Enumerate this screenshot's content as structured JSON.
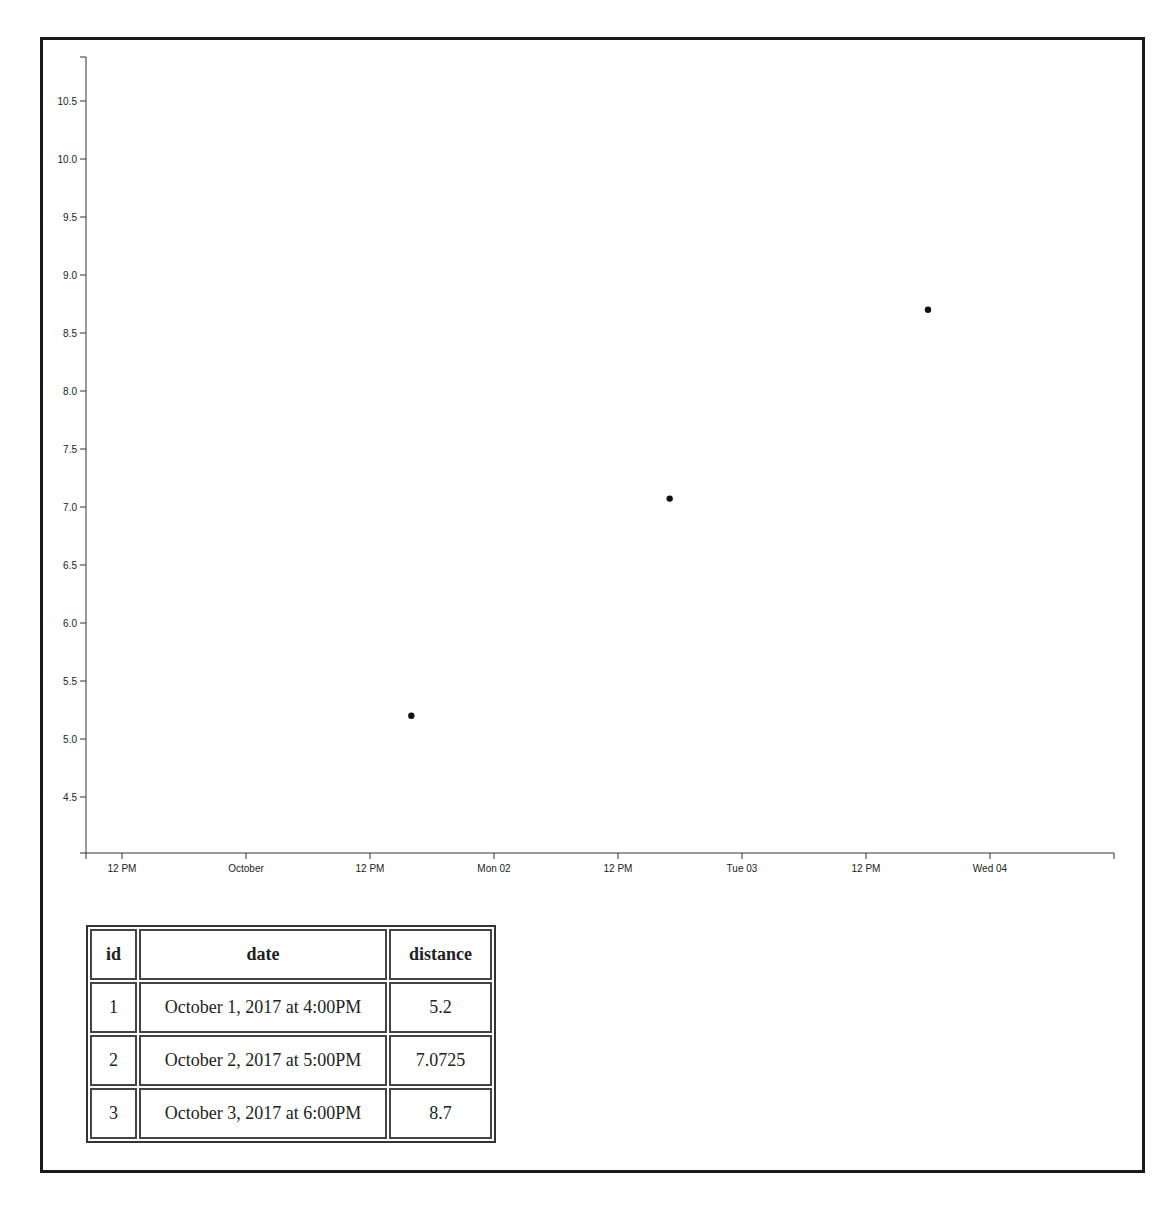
{
  "chart_data": {
    "type": "scatter",
    "title": "",
    "xlabel": "",
    "ylabel": "",
    "x_type": "time",
    "x_ticks": [
      "12 PM",
      "October",
      "12 PM",
      "Mon 02",
      "12 PM",
      "Tue 03",
      "12 PM",
      "Wed 04"
    ],
    "y_ticks": [
      "4.5",
      "5.0",
      "5.5",
      "6.0",
      "6.5",
      "7.0",
      "7.5",
      "8.0",
      "8.5",
      "9.0",
      "9.5",
      "10.0",
      "10.5"
    ],
    "ylim": [
      4.0,
      10.9
    ],
    "grid": false,
    "legend": null,
    "points": [
      {
        "x": "2017-10-01T16:00",
        "y": 5.2
      },
      {
        "x": "2017-10-02T17:00",
        "y": 7.0725
      },
      {
        "x": "2017-10-03T18:00",
        "y": 8.7
      }
    ],
    "x": [
      "October 1, 2017 at 4:00PM",
      "October 2, 2017 at 5:00PM",
      "October 3, 2017 at 6:00PM"
    ],
    "values": [
      5.2,
      7.0725,
      8.7
    ]
  },
  "table": {
    "headers": {
      "id": "id",
      "date": "date",
      "distance": "distance"
    },
    "rows": [
      {
        "id": "1",
        "date": "October 1, 2017 at 4:00PM",
        "distance": "5.2"
      },
      {
        "id": "2",
        "date": "October 2, 2017 at 5:00PM",
        "distance": "7.0725"
      },
      {
        "id": "3",
        "date": "October 3, 2017 at 6:00PM",
        "distance": "8.7"
      }
    ]
  }
}
